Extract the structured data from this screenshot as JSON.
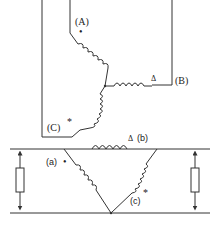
{
  "diagram": {
    "type": "circuit-schematic",
    "colors": {
      "line": "#333333",
      "background": "#ffffff",
      "caption": "#e2e2e2"
    },
    "primary_star": {
      "connection": "star",
      "windings": [
        {
          "terminal_label": "(A)",
          "polarity_mark": "•"
        },
        {
          "terminal_label": "(B)",
          "polarity_mark": "Δ"
        },
        {
          "terminal_label": "(C)",
          "polarity_mark": "*"
        }
      ]
    },
    "secondary_delta": {
      "connection": "delta",
      "windings": [
        {
          "terminal_label": "(a)",
          "polarity_mark": "•"
        },
        {
          "terminal_label": "(b)",
          "polarity_mark": "Δ"
        },
        {
          "terminal_label": "(c)",
          "polarity_mark": "*"
        }
      ]
    },
    "loads": [
      {
        "name": "left-resistor",
        "symbol": "resistor-with-double-arrow"
      },
      {
        "name": "right-resistor",
        "symbol": "resistor-with-double-arrow"
      }
    ],
    "caption": ""
  }
}
